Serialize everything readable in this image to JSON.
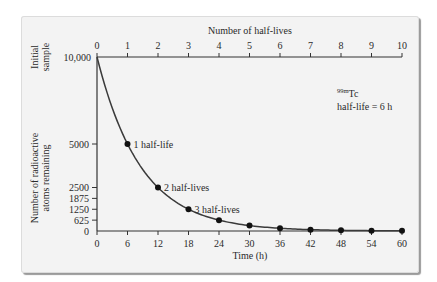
{
  "chart_data": {
    "type": "line",
    "title": "",
    "top_axis": {
      "label": "Number of half-lives",
      "ticks": [
        "0",
        "1",
        "2",
        "3",
        "4",
        "5",
        "6",
        "7",
        "8",
        "9",
        "10"
      ]
    },
    "xlabel": "Time (h)",
    "x_ticks": [
      "0",
      "6",
      "12",
      "18",
      "24",
      "30",
      "36",
      "42",
      "48",
      "54",
      "60"
    ],
    "ylabel": "Number of radioactive atoms remaining",
    "y_initial_label": "Initial sample",
    "y_ticks": [
      "0",
      "625",
      "1250",
      "1875",
      "2500",
      "5000",
      "10,000"
    ],
    "ylim": [
      0,
      10000
    ],
    "xlim": [
      0,
      60
    ],
    "grid": false,
    "series": [
      {
        "name": "99mTc decay",
        "x": [
          0,
          6,
          12,
          18,
          24,
          30,
          36,
          42,
          48,
          54,
          60
        ],
        "values": [
          10000,
          5000,
          2500,
          1250,
          625,
          312.5,
          156.25,
          78.1,
          39.1,
          19.5,
          9.8
        ],
        "markers_at": [
          6,
          12,
          18,
          24,
          30,
          36,
          42,
          48,
          54,
          60
        ]
      }
    ],
    "annotations": [
      {
        "x": 6,
        "y": 5000,
        "text": "1 half-life"
      },
      {
        "x": 12,
        "y": 2500,
        "text": "2 half-lives"
      },
      {
        "x": 18,
        "y": 1250,
        "text": "3 half-lives"
      }
    ],
    "legend_box": {
      "isotope_super": "99m",
      "isotope": "Tc",
      "half_life": "half-life = 6 h"
    }
  }
}
